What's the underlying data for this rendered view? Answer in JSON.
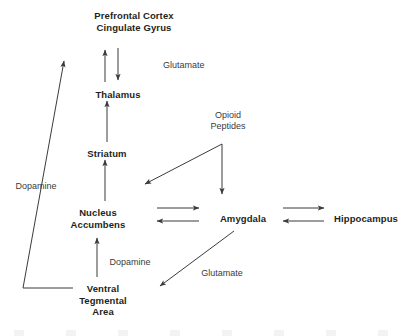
{
  "diagram": {
    "background_color": "#ffffff",
    "stroke_color": "#3b3b3d",
    "node_text_color": "#231f20",
    "label_text_color": "#3b3b3d",
    "nodes": [
      {
        "id": "prefrontal-cortex",
        "text": "Prefrontal Cortex\nCingulate Gyrus",
        "x": 134,
        "y": 10
      },
      {
        "id": "thalamus",
        "text": "Thalamus",
        "x": 118,
        "y": 89
      },
      {
        "id": "striatum",
        "text": "Striatum",
        "x": 107,
        "y": 148
      },
      {
        "id": "nucleus-accumbens",
        "text": "Nucleus\nAccumbens",
        "x": 98,
        "y": 207
      },
      {
        "id": "amygdala",
        "text": "Amygdala",
        "x": 243,
        "y": 213
      },
      {
        "id": "hippocampus",
        "text": "Hippocampus",
        "x": 366,
        "y": 213
      },
      {
        "id": "ventral-tegmental-area",
        "text": "Ventral\nTegmental\nArea",
        "x": 103,
        "y": 283
      }
    ],
    "edge_labels": [
      {
        "id": "glutamate-cortex-thalamus",
        "text": "Glutamate",
        "x": 163,
        "y": 60,
        "align": "left"
      },
      {
        "id": "opioid-peptides",
        "text": "Opioid\nPeptides",
        "x": 228,
        "y": 110,
        "align": "center"
      },
      {
        "id": "dopamine-vta-cortex",
        "text": "Dopamine",
        "x": 36,
        "y": 181,
        "align": "center"
      },
      {
        "id": "dopamine-vta-accumbens",
        "text": "Dopamine",
        "x": 130,
        "y": 257,
        "align": "center"
      },
      {
        "id": "glutamate-amygdala-vta",
        "text": "Glutamate",
        "x": 222,
        "y": 268,
        "align": "center"
      }
    ],
    "edges": [
      {
        "id": "thalamus-to-cortex",
        "from": "thalamus",
        "to": "prefrontal-cortex",
        "neurotransmitter": "Glutamate",
        "direction": "up"
      },
      {
        "id": "cortex-to-thalamus",
        "from": "prefrontal-cortex",
        "to": "thalamus",
        "neurotransmitter": "Glutamate",
        "direction": "down"
      },
      {
        "id": "striatum-to-thalamus",
        "from": "striatum",
        "to": "thalamus",
        "neurotransmitter": "",
        "direction": "up"
      },
      {
        "id": "accumbens-to-striatum",
        "from": "nucleus-accumbens",
        "to": "striatum",
        "neurotransmitter": "",
        "direction": "up"
      },
      {
        "id": "vta-to-accumbens",
        "from": "ventral-tegmental-area",
        "to": "nucleus-accumbens",
        "neurotransmitter": "Dopamine",
        "direction": "up"
      },
      {
        "id": "vta-to-cortex",
        "from": "ventral-tegmental-area",
        "to": "prefrontal-cortex",
        "neurotransmitter": "Dopamine",
        "direction": "up-left"
      },
      {
        "id": "opioid-to-accumbens",
        "from": "opioid-peptides",
        "to": "nucleus-accumbens",
        "neurotransmitter": "Opioid Peptides",
        "direction": "down-left"
      },
      {
        "id": "opioid-to-amygdala",
        "from": "opioid-peptides",
        "to": "amygdala",
        "neurotransmitter": "Opioid Peptides",
        "direction": "down"
      },
      {
        "id": "accumbens-to-amygdala",
        "from": "nucleus-accumbens",
        "to": "amygdala",
        "neurotransmitter": "",
        "direction": "right"
      },
      {
        "id": "amygdala-to-accumbens",
        "from": "amygdala",
        "to": "nucleus-accumbens",
        "neurotransmitter": "",
        "direction": "left"
      },
      {
        "id": "amygdala-to-hippocampus",
        "from": "amygdala",
        "to": "hippocampus",
        "neurotransmitter": "",
        "direction": "right"
      },
      {
        "id": "hippocampus-to-amygdala",
        "from": "hippocampus",
        "to": "amygdala",
        "neurotransmitter": "",
        "direction": "left"
      },
      {
        "id": "amygdala-to-vta",
        "from": "amygdala",
        "to": "ventral-tegmental-area",
        "neurotransmitter": "Glutamate",
        "direction": "down-left"
      }
    ]
  }
}
